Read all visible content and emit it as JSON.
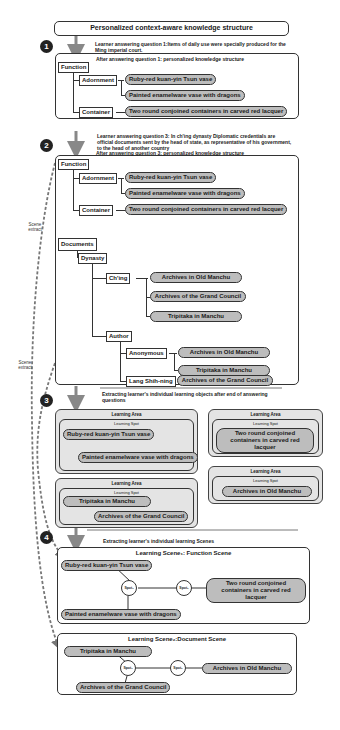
{
  "title": "Personalized context-aware knowledge structure",
  "steps": [
    {
      "number": "1"
    },
    {
      "number": "2"
    },
    {
      "number": "3"
    },
    {
      "number": "4"
    }
  ],
  "step1": {
    "question_note": "Learner answering question 1:Items of daily use were specially produced for the Ming imperial court.",
    "result_note": "After answering question 1: personalized knowledge structure",
    "function_label": "Function",
    "adornment_label": "Adornment",
    "container_label": "Container",
    "items": {
      "ruby_vase": "Ruby-red kuan-yin Tsun vase",
      "enamel_vase": "Painted enamelware vase with dragons",
      "lacquer": "Two round conjoined containers in carved red lacquer"
    }
  },
  "step2": {
    "question_note": "Learner answering question 3: In ch'ing dynasty Diplomatic credentials are official documents sent by the head of state, as representative of his government, to the head of another country",
    "result_note": "After answering question 3: personalized knowledge structure",
    "function_label": "Function",
    "adornment_label": "Adornment",
    "container_label": "Container",
    "items": {
      "ruby_vase": "Ruby-red kuan-yin Tsun vase",
      "enamel_vase": "Painted enamelware vase with dragons",
      "lacquer": "Two round conjoined containers in carved red lacquer"
    },
    "documents_label": "Documents",
    "dynasty_label": "Dynasty",
    "ching_label": "Ch'ing",
    "author_label": "Author",
    "anonymous_label": "Anonymous",
    "lang_label": "Lang Shih-ning",
    "ching_items": [
      "Archives in Old Manchu",
      "Archives of the Grand Council",
      "Tripitaka in Manchu"
    ],
    "anonymous_items": [
      "Archives in Old Manchu",
      "Tripitaka in Manchu"
    ],
    "lang_items": [
      "Archives of the Grand Council"
    ]
  },
  "side_labels": {
    "scene_extract_1": "Scene extract",
    "scene_extract_2": "Scene extract"
  },
  "step3": {
    "note": "Extracting learner's individual learning objects after end of answering questions",
    "areas": [
      {
        "title": "Learning Area",
        "spots_title": "Learning Spot",
        "items": [
          "Ruby-red kuan-yin Tsun vase",
          "Painted enamelware vase with dragons"
        ]
      },
      {
        "title": "Learning Area",
        "spots_title": "Learning Spot",
        "items": [
          "Two round conjoined containers in carved red lacquer"
        ]
      },
      {
        "title": "Learning Area",
        "spots_title": "Learning Spot",
        "items": [
          "Tripitaka in Manchu",
          "Archives of the Grand Council"
        ]
      },
      {
        "title": "Learning Area",
        "spots_title": "Learning Spot",
        "items": [
          "Archives in Old Manchu"
        ]
      }
    ]
  },
  "step4": {
    "note": "Extracting learner's individual learning Scenes",
    "scene1": {
      "title": "Learning Scene₁: Function Scene",
      "items": [
        "Ruby-red kuan-yin Tsun vase",
        "Two round conjoined containers in carved red lacquer",
        "Painted enamelware vase with dragons"
      ],
      "spot1": "Spot₁",
      "spot2": "Spot₂"
    },
    "scene2": {
      "title": "Learning Scene₂:Document Scene",
      "items": [
        "Tripitaka in Manchu",
        "Archives in Old Manchu",
        "Archives of the Grand Council"
      ],
      "spot1": "Spot₁",
      "spot2": "Spot₂"
    }
  },
  "colors": {
    "pill_fill": "#bdbdbd",
    "area_fill": "#e4e4e4",
    "line": "#333333",
    "arrow": "#888888",
    "badge": "#222222"
  }
}
